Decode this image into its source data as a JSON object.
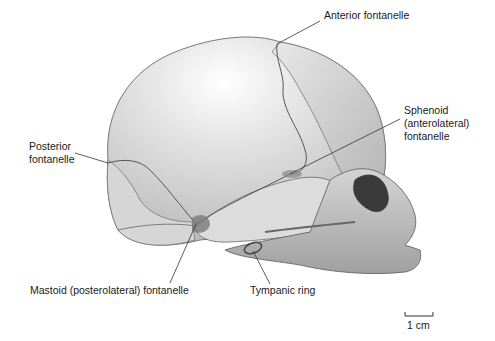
{
  "figure": {
    "labels": [
      {
        "id": "anterior",
        "text": "Anterior fontanelle",
        "x": 324,
        "y": 15,
        "line": [
          320,
          21,
          277,
          44
        ]
      },
      {
        "id": "sphenoid",
        "text": "Sphenoid\n(anterolateral)\nfontanelle",
        "x": 404,
        "y": 110,
        "line": [
          400,
          119,
          290,
          174
        ]
      },
      {
        "id": "posterior",
        "text": "Posterior\nfontanelle",
        "x": 29,
        "y": 146,
        "line": [
          75,
          153,
          108,
          163
        ]
      },
      {
        "id": "mastoid",
        "text": "Mastoid (posterolateral) fontanelle",
        "x": 30,
        "y": 283,
        "line": [
          196,
          224,
          170,
          283
        ]
      },
      {
        "id": "tympanic",
        "text": "Tympanic ring",
        "x": 250,
        "y": 283,
        "line": [
          253,
          251,
          270,
          284
        ]
      }
    ],
    "scale_bar": {
      "label": "1 cm",
      "x1": 405,
      "x2": 433,
      "y": 316
    }
  },
  "colors": {
    "bone_light": "#ececec",
    "bone_mid": "#c8c8c8",
    "bone_dark": "#8a8a8a",
    "suture": "#555555",
    "leader": "#333333",
    "text": "#1a1a1a"
  }
}
